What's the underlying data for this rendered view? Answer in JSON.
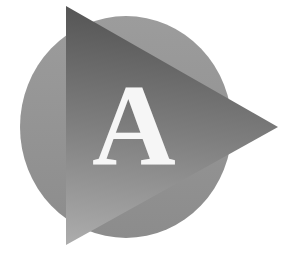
{
  "logo": {
    "letter": "A",
    "letter_color": "#f6f6f6",
    "circle": {
      "cx": 126,
      "cy": 127,
      "rx": 106,
      "ry": 111,
      "color_top": "#9c9c9c",
      "color_bottom": "#8c8c8c"
    },
    "triangle": {
      "points": "66,6 278,127 66,245",
      "color_top": "#545454",
      "color_mid": "#7e7e7e",
      "color_bottom": "#acacac"
    },
    "background": "#ffffff"
  }
}
